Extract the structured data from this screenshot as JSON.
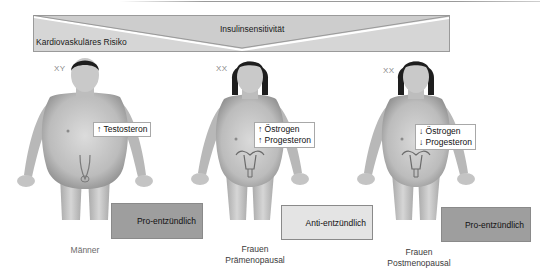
{
  "banner": {
    "top_label": "Insulinsensitivität",
    "left_label": "Kardiovaskuläres Risiko",
    "fill_color": "#d6d6d6",
    "border_color": "#9a9a9a"
  },
  "groups": [
    {
      "id": "maenner",
      "chromosomes": "XY",
      "hormones": [
        "↑ Testosteron"
      ],
      "inflammation": "Pro-entzündlich",
      "inflammation_color": "#9e9e9e",
      "caption_lines": [
        "Männer"
      ]
    },
    {
      "id": "frauen-praemenopausal",
      "chromosomes": "XX",
      "hormones": [
        "↑ Östrogen",
        "↑ Progesteron"
      ],
      "inflammation": "Anti-entzündlich",
      "inflammation_color": "#e4e4e4",
      "caption_lines": [
        "Frauen",
        "Prämenopausal"
      ]
    },
    {
      "id": "frauen-postmenopausal",
      "chromosomes": "XX",
      "hormones": [
        "↓ Östrogen",
        "↓ Progesteron"
      ],
      "inflammation": "Pro-entzündlich",
      "inflammation_color": "#9e9e9e",
      "caption_lines": [
        "Frauen",
        "Postmenopausal"
      ]
    }
  ],
  "colors": {
    "skin_light": "#d9d9d9",
    "skin_mid": "#b9b9b9",
    "skin_dark": "#8c8c8c",
    "hair": "#1e1e1e"
  }
}
